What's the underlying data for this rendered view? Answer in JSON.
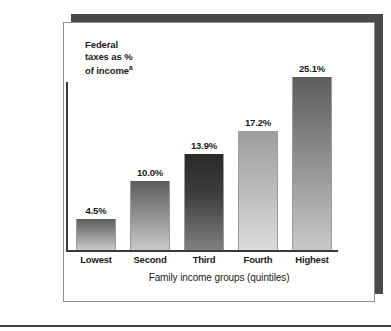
{
  "chart_data": {
    "type": "bar",
    "title": "",
    "categories": [
      "Lowest",
      "Second",
      "Third",
      "Fourth",
      "Highest"
    ],
    "values": [
      4.5,
      10.0,
      13.9,
      17.2,
      25.1
    ],
    "value_labels": [
      "4.5%",
      "10.0%",
      "13.9%",
      "17.2%",
      "25.1%"
    ],
    "ylabel": "Federal taxes as % of income",
    "ylabel_lines": [
      "Federal",
      "taxes as %",
      "of income"
    ],
    "ylabel_footnote_marker": "a",
    "xlabel": "Family income groups (quintiles)",
    "ylim": [
      0,
      27.5
    ],
    "grid": false,
    "legend": null,
    "bar_styles": [
      "medium",
      "medium",
      "dark",
      "light",
      "medium"
    ],
    "colors": {
      "bar_top_medium": "#5d5d5d",
      "bar_bottom_medium": "#c9c9c9",
      "bar_top_dark": "#2a2a2a",
      "bar_bottom_dark": "#7f7f7f",
      "bar_top_light": "#9e9e9e",
      "bar_bottom_light": "#dcdcdc",
      "axis": "#3a3a3a",
      "text": "#1a1a1a",
      "frame_border": "#8d8d8d",
      "frame_shadow": "#4a4a4a",
      "background": "#ffffff"
    }
  }
}
